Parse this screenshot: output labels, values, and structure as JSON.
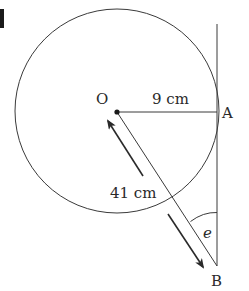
{
  "diagram": {
    "type": "geometry",
    "question_marker": "1",
    "points": {
      "O": {
        "label": "O",
        "x": 117,
        "y": 112
      },
      "A": {
        "label": "A",
        "x": 217,
        "y": 112
      },
      "B": {
        "label": "B",
        "x": 217,
        "y": 266
      }
    },
    "circle": {
      "center": "O",
      "cx": 117,
      "cy": 111,
      "r": 102
    },
    "tangent_line": {
      "x": 217,
      "y1": 24,
      "y2": 266
    },
    "measurements": {
      "OA": "9 cm",
      "OB": "41 cm"
    },
    "angle": {
      "label": "e",
      "vertex": "B",
      "between": [
        "BO",
        "BA"
      ]
    },
    "colors": {
      "stroke": "#3a3a3a",
      "text": "#2a2a2a",
      "background": "#ffffff"
    }
  }
}
